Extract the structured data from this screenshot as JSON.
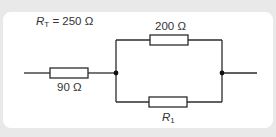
{
  "diagram": {
    "type": "circuit",
    "total_resistance": {
      "symbol": "R",
      "subscript": "T",
      "equals": "= 250 Ω"
    },
    "components": [
      {
        "id": "series-resistor",
        "label": "90 Ω"
      },
      {
        "id": "top-parallel-resistor",
        "label": "200 Ω"
      },
      {
        "id": "bottom-parallel-resistor",
        "symbol": "R",
        "subscript": "1"
      }
    ],
    "colors": {
      "wire": "#2b2b2b",
      "background": "#e9e9e9",
      "card": "#ffffff"
    }
  }
}
